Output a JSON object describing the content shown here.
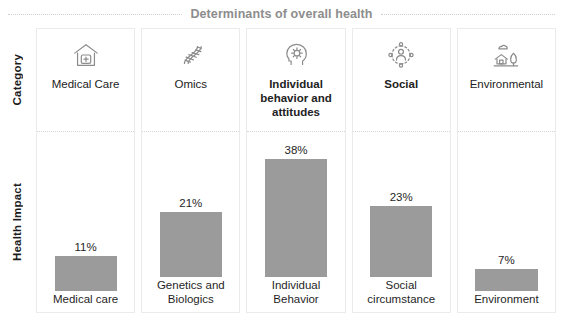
{
  "header": {
    "title": "Determinants of overall health"
  },
  "rows": {
    "category_label": "Category",
    "impact_label": "Health Impact"
  },
  "chart_data": {
    "type": "bar",
    "title": "Determinants of overall health",
    "xlabel": "",
    "ylabel": "Health Impact",
    "ylim": [
      0,
      40
    ],
    "grid": false,
    "legend": "none",
    "categories": [
      "Medical care",
      "Genetics and Biologics",
      "Individual Behavior",
      "Social circumstance",
      "Environment"
    ],
    "values": [
      11,
      21,
      38,
      23,
      7
    ],
    "value_labels": [
      "11%",
      "21%",
      "38%",
      "23%",
      "7%"
    ],
    "bar_color": "#9b9b9b"
  },
  "columns": [
    {
      "category_label": "Medical Care",
      "category_bold": false,
      "icon": "hospital-icon",
      "bar_label": "Medical care",
      "value": 11,
      "value_label": "11%"
    },
    {
      "category_label": "Omics",
      "category_bold": false,
      "icon": "dna-icon",
      "bar_label": "Genetics and Biologics",
      "value": 21,
      "value_label": "21%"
    },
    {
      "category_label": "Individual behavior and attitudes",
      "category_bold": true,
      "icon": "head-gear-icon",
      "bar_label": "Individual Behavior",
      "value": 38,
      "value_label": "38%"
    },
    {
      "category_label": "Social",
      "category_bold": true,
      "icon": "social-network-icon",
      "bar_label": "Social circumstance",
      "value": 23,
      "value_label": "23%"
    },
    {
      "category_label": "Environmental",
      "category_bold": false,
      "icon": "house-tree-icon",
      "bar_label": "Environment",
      "value": 7,
      "value_label": "7%"
    }
  ],
  "colors": {
    "bar": "#9b9b9b",
    "title": "#8d8d8d",
    "card_border": "#ebebeb",
    "divider": "#d6d6d6"
  }
}
